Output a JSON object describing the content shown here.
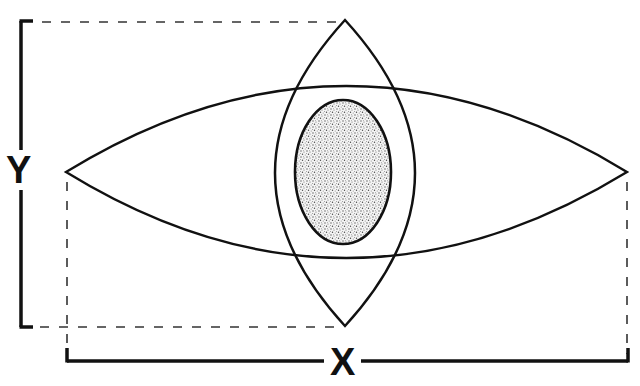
{
  "diagram": {
    "labels": {
      "x_axis": "X",
      "y_axis": "Y"
    },
    "shapes": {
      "horizontal_lens": {
        "left_tip": [
          66,
          172
        ],
        "right_tip": [
          627,
          172
        ],
        "top_y": 85,
        "bottom_y": 258
      },
      "vertical_lens": {
        "top_tip": [
          345,
          20
        ],
        "bottom_tip": [
          345,
          326
        ],
        "left_x": 275,
        "right_x": 413
      },
      "core_ellipse": {
        "cx": 343,
        "cy": 172,
        "rx": 48,
        "ry": 72,
        "fill": "stippled"
      }
    },
    "dimension_lines": {
      "y_bracket": {
        "x": 21,
        "top": 20,
        "bottom": 327
      },
      "x_bracket": {
        "y": 360,
        "left": 68,
        "right": 627
      }
    },
    "colors": {
      "stroke": "#111111",
      "background": "#ffffff",
      "stipple": "#7a7a7a"
    }
  }
}
